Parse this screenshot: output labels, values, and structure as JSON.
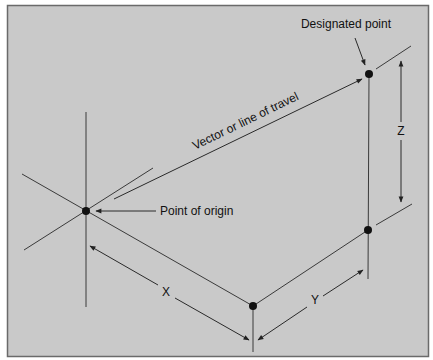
{
  "diagram": {
    "colors": {
      "background": "#c9c9c9",
      "frame": "#6a6a6a",
      "line": "#3a3a3a",
      "point": "#111111",
      "text": "#111111"
    },
    "labels": {
      "designated_point": "Designated point",
      "vector": "Vector or line of travel",
      "point_of_origin": "Point of origin",
      "x_axis": "X",
      "y_axis": "Y",
      "z_axis": "Z"
    },
    "points": {
      "origin": {
        "x": 86,
        "y": 211
      },
      "x_end": {
        "x": 253,
        "y": 306
      },
      "y_end": {
        "x": 368,
        "y": 230
      },
      "designated": {
        "x": 369,
        "y": 74
      }
    }
  }
}
